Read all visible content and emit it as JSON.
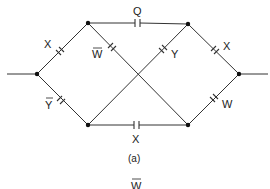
{
  "figure": {
    "caption": "(a)",
    "bottom_label": {
      "text": "W",
      "overbar": true
    }
  },
  "nodes": [
    {
      "id": "in",
      "x": 37,
      "y": 74
    },
    {
      "id": "top-left",
      "x": 88,
      "y": 23
    },
    {
      "id": "top-right",
      "x": 188,
      "y": 24
    },
    {
      "id": "bottom-left",
      "x": 88,
      "y": 125
    },
    {
      "id": "bottom-right",
      "x": 188,
      "y": 125
    },
    {
      "id": "out",
      "x": 239,
      "y": 74
    }
  ],
  "terminals": {
    "input": {
      "x1": 7,
      "y1": 74,
      "x2": 37,
      "y2": 74
    },
    "output": {
      "x1": 239,
      "y1": 74,
      "x2": 268,
      "y2": 74
    }
  },
  "contacts": [
    {
      "id": "x-top-left",
      "label": "X",
      "overbar": false,
      "from": "in",
      "to": "top-left"
    },
    {
      "id": "ybar-bottom-left",
      "label": "Y",
      "overbar": true,
      "from": "in",
      "to": "bottom-left"
    },
    {
      "id": "q-top",
      "label": "Q",
      "overbar": false,
      "from": "top-left",
      "to": "top-right"
    },
    {
      "id": "wbar-diag",
      "label": "W",
      "overbar": true,
      "from": "top-left",
      "to": "bottom-right"
    },
    {
      "id": "y-diag",
      "label": "Y",
      "overbar": false,
      "from": "bottom-left",
      "to": "top-right"
    },
    {
      "id": "x-bottom",
      "label": "X",
      "overbar": false,
      "from": "bottom-left",
      "to": "bottom-right"
    },
    {
      "id": "x-top-right",
      "label": "X",
      "overbar": false,
      "from": "top-right",
      "to": "out"
    },
    {
      "id": "w-bottom-right",
      "label": "W",
      "overbar": false,
      "from": "bottom-right",
      "to": "out"
    }
  ],
  "labels": {
    "x_top_left": "X",
    "ybar_bottom_left": "Y",
    "q_top": "Q",
    "wbar_diag": "W",
    "y_diag": "Y",
    "x_bottom": "X",
    "x_top_right": "X",
    "w_bottom_right": "W"
  },
  "colors": {
    "line": "#333333",
    "node": "#111111",
    "background": "#ffffff"
  }
}
